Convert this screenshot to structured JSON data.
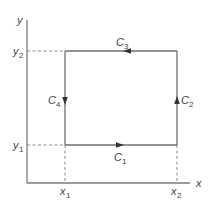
{
  "diagram": {
    "type": "closed-path-rectangle",
    "axes": {
      "x_label": "x",
      "y_label": "y"
    },
    "ticks": {
      "x1": {
        "base": "x",
        "sub": "1"
      },
      "x2": {
        "base": "x",
        "sub": "2"
      },
      "y1": {
        "base": "y",
        "sub": "1"
      },
      "y2": {
        "base": "y",
        "sub": "2"
      }
    },
    "segments": [
      {
        "id": "C1",
        "base": "C",
        "sub": "1",
        "from": "(x1,y1)",
        "to": "(x2,y1)",
        "direction": "right"
      },
      {
        "id": "C2",
        "base": "C",
        "sub": "2",
        "from": "(x2,y1)",
        "to": "(x2,y2)",
        "direction": "up"
      },
      {
        "id": "C3",
        "base": "C",
        "sub": "3",
        "from": "(x2,y2)",
        "to": "(x1,y2)",
        "direction": "left"
      },
      {
        "id": "C4",
        "base": "C",
        "sub": "4",
        "from": "(x1,y2)",
        "to": "(x1,y1)",
        "direction": "down"
      }
    ],
    "orientation": "counterclockwise",
    "colors": {
      "line": "#6e6e6e",
      "arrow": "#333333",
      "text": "#444444"
    }
  }
}
